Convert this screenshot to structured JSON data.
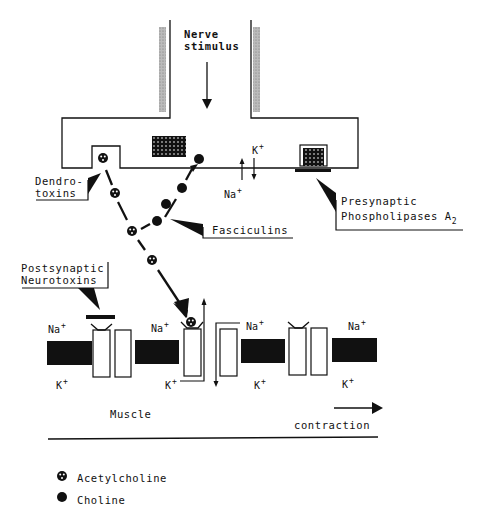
{
  "diagram": {
    "nerve_stimulus": {
      "line1": "Nerve",
      "line2": "stimulus"
    },
    "callouts": {
      "dendrotoxins": {
        "line1": "Dendro-",
        "line2": "toxins"
      },
      "fasciculins": "Fasciculins",
      "presynaptic_pla2": {
        "line1": "Presynaptic",
        "line2": "Phospholipases A",
        "subscript": "2"
      },
      "postsynaptic_neurotoxins": {
        "line1": "Postsynaptic",
        "line2": "Neurotoxins"
      }
    },
    "ions": {
      "k_plus": "K",
      "na_plus": "Na",
      "plus": "+"
    },
    "muscle_label": "Muscle",
    "contraction_label": "contraction",
    "legend": {
      "items": [
        {
          "symbol": "dotted-circle",
          "label": "Acetylcholine"
        },
        {
          "symbol": "filled-circle",
          "label": "Choline"
        }
      ]
    }
  }
}
